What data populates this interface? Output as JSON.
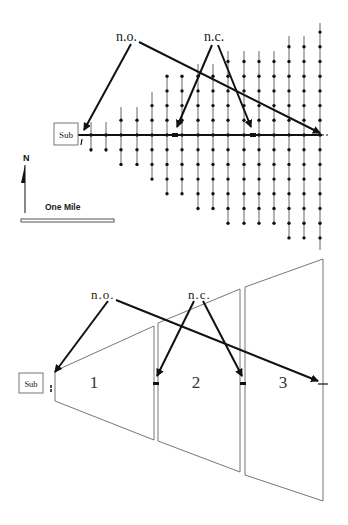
{
  "top_diagram": {
    "substation_label": "Sub",
    "normally_open_label": "n.o.",
    "normally_closed_label": "n.c.",
    "north_label": "N",
    "scale_label": "One Mile",
    "main_feeder_y": 135,
    "columns": [
      {
        "x": 91,
        "top": 122,
        "bottom": 152
      },
      {
        "x": 106,
        "top": 122,
        "bottom": 152
      },
      {
        "x": 121,
        "top": 107,
        "bottom": 166
      },
      {
        "x": 137,
        "top": 107,
        "bottom": 166
      },
      {
        "x": 152,
        "top": 92,
        "bottom": 180
      },
      {
        "x": 167,
        "top": 77,
        "bottom": 195
      },
      {
        "x": 182,
        "top": 77,
        "bottom": 195
      },
      {
        "x": 198,
        "top": 64,
        "bottom": 209
      },
      {
        "x": 213,
        "top": 64,
        "bottom": 209
      },
      {
        "x": 228,
        "top": 51,
        "bottom": 223
      },
      {
        "x": 244,
        "top": 51,
        "bottom": 223
      },
      {
        "x": 259,
        "top": 51,
        "bottom": 223
      },
      {
        "x": 274,
        "top": 51,
        "bottom": 223
      },
      {
        "x": 289,
        "top": 36,
        "bottom": 237
      },
      {
        "x": 304,
        "top": 36,
        "bottom": 237
      },
      {
        "x": 320,
        "top": 23,
        "bottom": 250
      }
    ]
  },
  "bottom_diagram": {
    "substation_label": "Sub",
    "normally_open_label": "n.o.",
    "normally_closed_label": "n.c.",
    "zones": [
      {
        "label": "1"
      },
      {
        "label": "2"
      },
      {
        "label": "3"
      }
    ]
  },
  "colors": {
    "line": "#111111",
    "thin_line": "#777777",
    "background": "#ffffff"
  }
}
